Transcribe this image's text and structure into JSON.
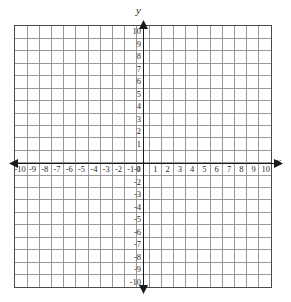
{
  "figure": {
    "kind": "cartesian-coordinate-grid",
    "background_color": "#ffffff",
    "grid_line_color": "#8d8d8d",
    "border_color": "#4a4a4a",
    "axis_color": "#1a1a1a",
    "label_color": "#2b2b2b"
  },
  "axes": {
    "x_name": "x",
    "y_name": "y",
    "origin_label": "0"
  },
  "chart_data": {
    "type": "scatter",
    "title": "",
    "subtitle": "",
    "xlabel": "x",
    "ylabel": "y",
    "xlim": [
      -10.5,
      10.5
    ],
    "ylim": [
      -10.5,
      10.5
    ],
    "x_tick_step": 1,
    "y_tick_step": 1,
    "grid": true,
    "grid_cells_x": 21,
    "grid_cells_y": 21,
    "legend": false,
    "legend_position": "none",
    "series": [],
    "annotations": [],
    "x_ticks": [
      -10,
      -9,
      -8,
      -7,
      -6,
      -5,
      -4,
      -3,
      -2,
      -1,
      0,
      1,
      2,
      3,
      4,
      5,
      6,
      7,
      8,
      9,
      10
    ],
    "y_ticks": [
      10,
      9,
      8,
      7,
      6,
      5,
      4,
      3,
      2,
      1,
      -1,
      -2,
      -3,
      -4,
      -5,
      -6,
      -7,
      -8,
      -9,
      -10
    ],
    "x_tick_labels": [
      "-10",
      "-9",
      "-8",
      "-7",
      "-6",
      "-5",
      "-4",
      "-3",
      "-2",
      "-1",
      "0",
      "1",
      "2",
      "3",
      "4",
      "5",
      "6",
      "7",
      "8",
      "9",
      "10"
    ],
    "y_tick_labels": [
      "10",
      "9",
      "8",
      "7",
      "6",
      "5",
      "4",
      "3",
      "2",
      "1",
      "-1",
      "-2",
      "-3",
      "-4",
      "-5",
      "-6",
      "-7",
      "-8",
      "-9",
      "-10"
    ]
  },
  "arrows": {
    "left": "arrow-left",
    "right": "arrow-right",
    "up": "arrow-up",
    "down": "arrow-down"
  }
}
